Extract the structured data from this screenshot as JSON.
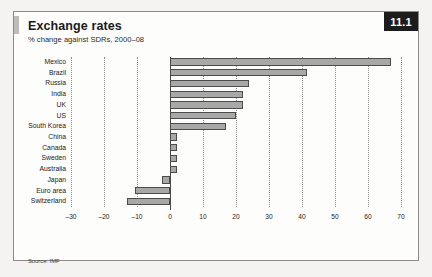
{
  "figure": {
    "number": "11.1",
    "title": "Exchange rates",
    "subtitle": "% change against SDRs, 2000–08",
    "source": "Source: IMF"
  },
  "chart_data": {
    "type": "bar",
    "orientation": "horizontal",
    "title": "Exchange rates",
    "subtitle": "% change against SDRs, 2000–08",
    "xlabel": "",
    "ylabel": "",
    "xlim": [
      -30,
      70
    ],
    "xticks": [
      -30,
      -20,
      -10,
      0,
      10,
      20,
      30,
      40,
      50,
      60,
      70
    ],
    "xtick_labels": [
      "–30",
      "–20",
      "–10",
      "0",
      "10",
      "20",
      "30",
      "40",
      "50",
      "60",
      "70"
    ],
    "grid": "vertical-dotted",
    "legend": "none",
    "bar_fill": "#a8a8a8",
    "bar_edge": "#4b4b4b",
    "categories": [
      "Mexico",
      "Brazil",
      "Russia",
      "India",
      "UK",
      "US",
      "South Korea",
      "China",
      "Canada",
      "Sweden",
      "Australia",
      "Japan",
      "Euro area",
      "Switzerland"
    ],
    "values": [
      67,
      41.5,
      24,
      22,
      22,
      20,
      17,
      2,
      2,
      2,
      2,
      -2.5,
      -10.5,
      -13
    ]
  }
}
